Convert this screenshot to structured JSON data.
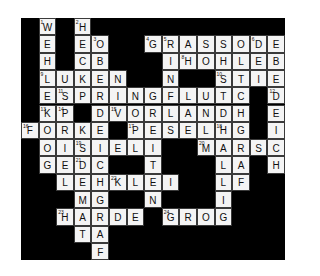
{
  "puzzle": {
    "type": "crossword-grid",
    "columns": 15,
    "rows": 14,
    "cell_width": 17.6,
    "cell_height": 17.3,
    "colors": {
      "block": "#000000",
      "open_cell": "#f4f4f4",
      "cell_border": "#3a3a3a",
      "letter": "#101010",
      "page_background": "#ffffff"
    },
    "grid": [
      [
        null,
        {
          "l": "W",
          "n": "1"
        },
        null,
        {
          "l": "H",
          "n": "2"
        },
        null,
        null,
        null,
        null,
        null,
        null,
        null,
        null,
        null,
        null,
        null
      ],
      [
        null,
        {
          "l": "E"
        },
        null,
        {
          "l": "E"
        },
        {
          "l": "O",
          "n": "3"
        },
        null,
        null,
        {
          "l": "G",
          "n": "4"
        },
        {
          "l": "R",
          "n": "5"
        },
        {
          "l": "A"
        },
        {
          "l": "S"
        },
        {
          "l": "S"
        },
        {
          "l": "O"
        },
        {
          "l": "D",
          "n": "6"
        },
        {
          "l": "E"
        }
      ],
      [
        null,
        {
          "l": "H"
        },
        null,
        {
          "l": "C"
        },
        {
          "l": "B"
        },
        null,
        null,
        null,
        {
          "l": "I"
        },
        {
          "l": "H",
          "n": "8"
        },
        {
          "l": "O"
        },
        {
          "l": "H"
        },
        {
          "l": "L"
        },
        {
          "l": "E"
        },
        {
          "l": "B"
        }
      ],
      [
        null,
        {
          "l": "L",
          "n": "9"
        },
        {
          "l": "U"
        },
        {
          "l": "K"
        },
        {
          "l": "E"
        },
        {
          "l": "N"
        },
        null,
        null,
        {
          "l": "N"
        },
        null,
        null,
        {
          "l": "S",
          "n": "10"
        },
        {
          "l": "T"
        },
        {
          "l": "I"
        },
        {
          "l": "E"
        }
      ],
      [
        null,
        {
          "l": "E"
        },
        {
          "l": "S",
          "n": "11"
        },
        {
          "l": "P"
        },
        {
          "l": "R"
        },
        {
          "l": "I"
        },
        {
          "l": "N"
        },
        {
          "l": "G"
        },
        {
          "l": "F"
        },
        {
          "l": "L"
        },
        {
          "l": "U"
        },
        {
          "l": "T"
        },
        {
          "l": "C"
        },
        null,
        {
          "l": "D",
          "n": "12"
        }
      ],
      [
        null,
        {
          "l": "K",
          "n": "13"
        },
        {
          "l": "P",
          "n": "14"
        },
        null,
        {
          "l": "D"
        },
        {
          "l": "V",
          "n": "15"
        },
        {
          "l": "O"
        },
        {
          "l": "R"
        },
        {
          "l": "L"
        },
        {
          "l": "A"
        },
        {
          "l": "N"
        },
        {
          "l": "D"
        },
        {
          "l": "H"
        },
        null,
        {
          "l": "E"
        }
      ],
      [
        {
          "l": "F",
          "n": "16"
        },
        {
          "l": "O"
        },
        {
          "l": "R"
        },
        {
          "l": "K"
        },
        {
          "l": "E"
        },
        null,
        {
          "l": "P",
          "n": "17"
        },
        {
          "l": "E"
        },
        {
          "l": "S"
        },
        {
          "l": "E"
        },
        {
          "l": "L"
        },
        {
          "l": "H",
          "n": "18"
        },
        {
          "l": "G"
        },
        null,
        {
          "l": "I"
        }
      ],
      [
        null,
        {
          "l": "O"
        },
        {
          "l": "I"
        },
        {
          "l": "S",
          "n": "19"
        },
        {
          "l": "I"
        },
        {
          "l": "E"
        },
        {
          "l": "L"
        },
        {
          "l": "I"
        },
        null,
        null,
        {
          "l": "M",
          "n": "20"
        },
        {
          "l": "A"
        },
        {
          "l": "R"
        },
        {
          "l": "S"
        },
        {
          "l": "C"
        }
      ],
      [
        null,
        {
          "l": "G"
        },
        {
          "l": "E"
        },
        {
          "l": "D",
          "n": "21"
        },
        {
          "l": "C"
        },
        null,
        null,
        {
          "l": "T"
        },
        null,
        null,
        null,
        {
          "l": "L"
        },
        {
          "l": "A"
        },
        null,
        {
          "l": "H"
        }
      ],
      [
        null,
        null,
        {
          "l": "L"
        },
        {
          "l": "E"
        },
        {
          "l": "H"
        },
        {
          "l": "K",
          "n": "22"
        },
        {
          "l": "L"
        },
        {
          "l": "E"
        },
        {
          "l": "I"
        },
        null,
        null,
        {
          "l": "L"
        },
        {
          "l": "F"
        },
        null,
        null
      ],
      [
        null,
        null,
        null,
        {
          "l": "M"
        },
        {
          "l": "G"
        },
        null,
        null,
        {
          "l": "N"
        },
        null,
        null,
        null,
        {
          "l": "I"
        },
        null,
        null,
        null
      ],
      [
        null,
        null,
        {
          "l": "H",
          "n": "23"
        },
        {
          "l": "A"
        },
        {
          "l": "R"
        },
        {
          "l": "D"
        },
        {
          "l": "E"
        },
        null,
        {
          "l": "G",
          "n": "24"
        },
        {
          "l": "R"
        },
        {
          "l": "O"
        },
        {
          "l": "G"
        },
        null,
        null,
        null
      ],
      [
        null,
        null,
        null,
        {
          "l": "T"
        },
        {
          "l": "A"
        },
        null,
        null,
        null,
        null,
        null,
        null,
        null,
        null,
        null,
        null
      ],
      [
        null,
        null,
        null,
        null,
        {
          "l": "F"
        },
        null,
        null,
        null,
        null,
        null,
        null,
        null,
        null,
        null,
        null
      ]
    ]
  }
}
